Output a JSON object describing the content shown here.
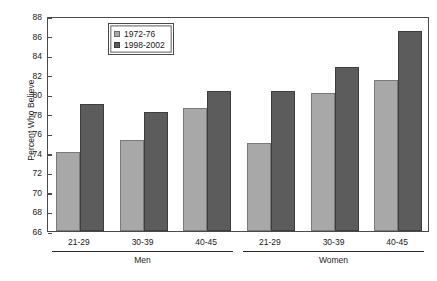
{
  "chart_data": {
    "type": "bar",
    "title": "",
    "xlabel": "",
    "ylabel": "Percent Who Believe",
    "ylim": [
      66,
      88
    ],
    "ytick_step": 2,
    "yticks": [
      66,
      68,
      70,
      72,
      74,
      76,
      78,
      80,
      82,
      84,
      86,
      88
    ],
    "grid": false,
    "legend_position": "top-center",
    "categories": [
      "21-29",
      "30-39",
      "40-45",
      "21-29",
      "30-39",
      "40-45"
    ],
    "groups": [
      {
        "label": "Men",
        "categories": [
          "21-29",
          "30-39",
          "40-45"
        ]
      },
      {
        "label": "Women",
        "categories": [
          "21-29",
          "30-39",
          "40-45"
        ]
      }
    ],
    "series": [
      {
        "name": "1972-76",
        "color": "#a8a8a8",
        "values": [
          74.1,
          75.3,
          78.6,
          75.0,
          80.1,
          81.5
        ]
      },
      {
        "name": "1998-2002",
        "color": "#5c5c5c",
        "values": [
          79.0,
          78.2,
          80.3,
          80.3,
          82.8,
          86.5
        ]
      }
    ]
  },
  "legend": {
    "entries": [
      {
        "label": "1972-76"
      },
      {
        "label": "1998-2002"
      }
    ]
  },
  "caption": ""
}
